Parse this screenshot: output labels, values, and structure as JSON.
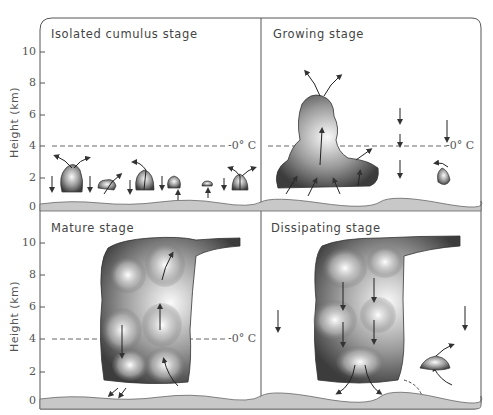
{
  "figure": {
    "type": "thunderstorm life-cycle diagram",
    "y_axis": {
      "label": "Height (km)",
      "ticks": [
        "10",
        "8",
        "6",
        "4",
        "2",
        "0"
      ]
    },
    "freezing_level_label": "-0° C",
    "panels": [
      {
        "id": "isolated",
        "title": "Isolated cumulus stage"
      },
      {
        "id": "growing",
        "title": "Growing stage"
      },
      {
        "id": "mature",
        "title": "Mature stage"
      },
      {
        "id": "dissipating",
        "title": "Dissipating stage"
      }
    ]
  },
  "colors": {
    "frame": "#555555",
    "ground": "#c8c8c8",
    "cloud_dark": "#4a4a4a",
    "cloud_light": "#f2f2f2"
  }
}
